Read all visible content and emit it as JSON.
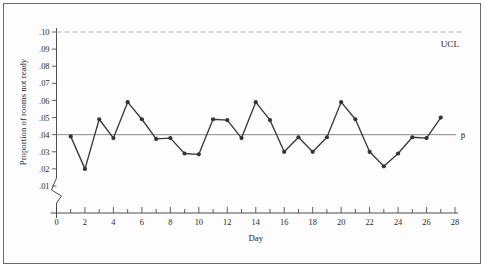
{
  "chart_data": {
    "type": "line",
    "title": "",
    "xlabel": "Day",
    "ylabel": "Proportion of rooms not ready",
    "x": [
      1,
      2,
      3,
      4,
      5,
      6,
      7,
      8,
      9,
      10,
      11,
      12,
      13,
      14,
      15,
      16,
      17,
      18,
      19,
      20,
      21,
      22,
      23,
      24,
      25,
      26,
      27
    ],
    "values": [
      0.039,
      0.02,
      0.049,
      0.038,
      0.059,
      0.049,
      0.0375,
      0.038,
      0.029,
      0.0285,
      0.049,
      0.0485,
      0.038,
      0.059,
      0.0485,
      0.03,
      0.0385,
      0.03,
      0.0385,
      0.059,
      0.049,
      0.03,
      0.0215,
      0.029,
      0.0385,
      0.038,
      0.05
    ],
    "series": [
      {
        "name": "Proportion of rooms not ready",
        "values": [
          0.039,
          0.02,
          0.049,
          0.038,
          0.059,
          0.049,
          0.0375,
          0.038,
          0.029,
          0.0285,
          0.049,
          0.0485,
          0.038,
          0.059,
          0.0485,
          0.03,
          0.0385,
          0.03,
          0.0385,
          0.059,
          0.049,
          0.03,
          0.0215,
          0.029,
          0.0385,
          0.038,
          0.05
        ]
      }
    ],
    "xlim": [
      0,
      28
    ],
    "ylim": [
      0.005,
      0.1
    ],
    "xticks": [
      0,
      2,
      4,
      6,
      8,
      10,
      12,
      14,
      16,
      18,
      20,
      22,
      24,
      26,
      28
    ],
    "xtick_labels": [
      "0",
      "2",
      "4",
      "6",
      "8",
      "10",
      "12",
      "14",
      "16",
      "18",
      "20",
      "22",
      "24",
      "26",
      "28"
    ],
    "xminor_ticks": [
      1,
      3,
      5,
      7,
      9,
      11,
      13,
      15,
      17,
      19,
      21,
      23,
      25,
      27
    ],
    "yticks": [
      0.01,
      0.02,
      0.03,
      0.04,
      0.05,
      0.06,
      0.07,
      0.08,
      0.09,
      0.1
    ],
    "ytick_labels": [
      ".01",
      ".02",
      ".03",
      ".04",
      ".05",
      ".06",
      ".07",
      ".08",
      ".09",
      ".10"
    ],
    "grid": false,
    "legend": "none",
    "axis_break": true,
    "reference_lines": [
      {
        "name": "UCL",
        "label": "UCL",
        "value": 0.1,
        "style": "dashed"
      },
      {
        "name": "p-bar",
        "label": "p̄",
        "value": 0.04,
        "style": "solid"
      }
    ],
    "annotations": [
      {
        "name": "ucl-annotation",
        "text": "UCL",
        "value": 0.1
      },
      {
        "name": "pbar-annotation",
        "text": "p̄",
        "value": 0.04
      }
    ]
  },
  "axes": {
    "x_title": "Day",
    "y_title": "Proportion of rooms not ready"
  },
  "colors": {
    "line": "#3b3b3b",
    "marker": "#343434",
    "center_line": "#7d7d7d",
    "ucl_line": "#a8a8a8",
    "axis": "#3a3a3a",
    "frame": "#6b6b6b",
    "background": "#ffffff"
  }
}
